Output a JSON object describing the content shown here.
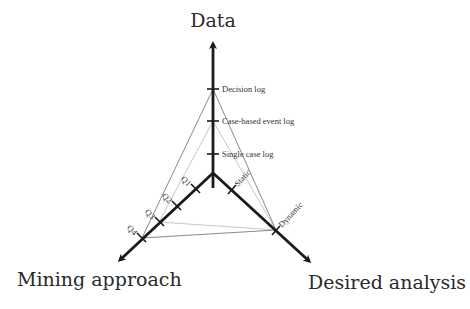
{
  "diagram": {
    "axes": [
      {
        "id": "data",
        "title": "Data",
        "ticks": [
          "Single case log",
          "Case-based event log",
          "Decision log"
        ]
      },
      {
        "id": "mining",
        "title": "Mining approach",
        "ticks": [
          "Q1",
          "Q2",
          "Q3",
          "Q4"
        ]
      },
      {
        "id": "analysis",
        "title": "Desired analysis",
        "ticks": [
          "Static",
          "Dynamic"
        ]
      }
    ],
    "profiles": [
      {
        "name": "profile-outer",
        "data": "Decision log",
        "mining": "Q4",
        "analysis": "Dynamic",
        "color": "#8a8a8a"
      },
      {
        "name": "profile-inner",
        "data": "Case-based event log",
        "mining": "Q3",
        "analysis": "Dynamic",
        "color": "#c8c8c8"
      }
    ],
    "axis_color": "#1a1a1a"
  }
}
